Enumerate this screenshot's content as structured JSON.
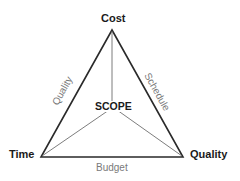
{
  "diagram": {
    "vertices": {
      "top": {
        "label": "Cost",
        "x": 112,
        "y": 30
      },
      "bottom_left": {
        "label": "Time",
        "x": 41,
        "y": 157
      },
      "bottom_right": {
        "label": "Quality",
        "x": 183,
        "y": 157
      }
    },
    "center": {
      "label": "SCOPE",
      "x": 112,
      "y": 108
    },
    "edges": {
      "left": {
        "label": "Quality"
      },
      "right": {
        "label": "Schedule"
      },
      "bottom": {
        "label": "Budget"
      }
    },
    "colors": {
      "outer_stroke": "#2a2a2a",
      "inner_stroke": "#6e6e6e",
      "edge_label": "#7a7a7a",
      "vertex_label": "#1a1a1a"
    }
  }
}
